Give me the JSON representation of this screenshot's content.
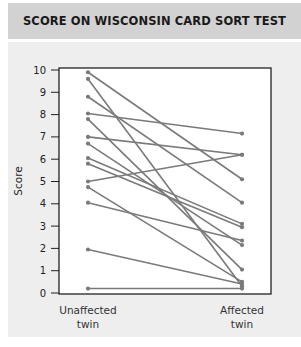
{
  "title": "SCORE ON WISCONSIN CARD SORT TEST",
  "colors": {
    "title_bar": "#d2d2d2",
    "panel": "#eeeeee",
    "plot_bg": "#ffffff",
    "line": "#7a7a7a",
    "axis": "#222222"
  },
  "chart_data": {
    "type": "line",
    "title": "SCORE ON WISCONSIN CARD SORT TEST",
    "xlabel": "",
    "ylabel": "Score",
    "categories": [
      "Unaffected twin",
      "Affected twin"
    ],
    "category_label_lines": [
      [
        "Unaffected",
        "twin"
      ],
      [
        "Affected",
        "twin"
      ]
    ],
    "ylim": [
      0,
      10
    ],
    "yticks": [
      0,
      1,
      2,
      3,
      4,
      5,
      6,
      7,
      8,
      9,
      10
    ],
    "grid": false,
    "legend": null,
    "series": [
      {
        "name": "Pair 1",
        "values": [
          9.9,
          5.1
        ]
      },
      {
        "name": "Pair 2",
        "values": [
          9.6,
          0.3
        ]
      },
      {
        "name": "Pair 3",
        "values": [
          8.8,
          4.05
        ]
      },
      {
        "name": "Pair 4",
        "values": [
          8.05,
          7.15
        ]
      },
      {
        "name": "Pair 5",
        "values": [
          7.8,
          1.05
        ]
      },
      {
        "name": "Pair 6",
        "values": [
          7.0,
          6.2
        ]
      },
      {
        "name": "Pair 7",
        "values": [
          6.7,
          2.15
        ]
      },
      {
        "name": "Pair 8",
        "values": [
          6.05,
          3.1
        ]
      },
      {
        "name": "Pair 9",
        "values": [
          5.8,
          2.95
        ]
      },
      {
        "name": "Pair 10",
        "values": [
          5.0,
          6.2
        ]
      },
      {
        "name": "Pair 11",
        "values": [
          4.75,
          0.5
        ]
      },
      {
        "name": "Pair 12",
        "values": [
          4.05,
          2.35
        ]
      },
      {
        "name": "Pair 13",
        "values": [
          1.95,
          0.4
        ]
      },
      {
        "name": "Pair 14",
        "values": [
          0.2,
          0.2
        ]
      }
    ]
  }
}
